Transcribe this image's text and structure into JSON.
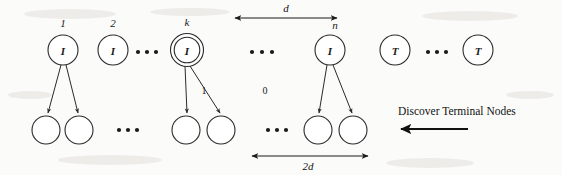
{
  "diagram": {
    "colors": {
      "stroke": "#2a2a2a",
      "text": "#1a1a1a",
      "background": "#fbfbfa",
      "flow_arrow": "#111111"
    },
    "internal_nodes": [
      {
        "id": "n1",
        "label": "I",
        "index": "1",
        "cx": 63,
        "cy": 50,
        "r": 15,
        "double": false
      },
      {
        "id": "n2",
        "label": "I",
        "index": "2",
        "cx": 113,
        "cy": 50,
        "r": 15,
        "double": false
      },
      {
        "id": "nk",
        "label": "I",
        "index": "k",
        "cx": 187,
        "cy": 50,
        "r": 15,
        "double": true
      },
      {
        "id": "nn",
        "label": "I",
        "index": "n",
        "cx": 330,
        "cy": 50,
        "r": 15,
        "double": false
      }
    ],
    "terminal_nodes": [
      {
        "id": "t1",
        "label": "T",
        "cx": 395,
        "cy": 50,
        "r": 15
      },
      {
        "id": "t2",
        "label": "T",
        "cx": 478,
        "cy": 50,
        "r": 15
      }
    ],
    "leaf_nodes": [
      {
        "id": "l1",
        "cx": 46,
        "cy": 130,
        "r": 14
      },
      {
        "id": "l2",
        "cx": 79,
        "cy": 130,
        "r": 14
      },
      {
        "id": "l3",
        "cx": 186,
        "cy": 130,
        "r": 14
      },
      {
        "id": "l4",
        "cx": 221,
        "cy": 130,
        "r": 14
      },
      {
        "id": "l5",
        "cx": 318,
        "cy": 130,
        "r": 14
      },
      {
        "id": "l6",
        "cx": 353,
        "cy": 130,
        "r": 14
      }
    ],
    "ellipses_top": [
      {
        "id": "e-top-1",
        "cx": 147,
        "cy": 52
      },
      {
        "id": "e-top-2",
        "cx": 262,
        "cy": 52
      },
      {
        "id": "e-top-3",
        "cx": 437,
        "cy": 52
      }
    ],
    "ellipses_bottom": [
      {
        "id": "e-bot-1",
        "cx": 128,
        "cy": 130
      },
      {
        "id": "e-bot-2",
        "cx": 277,
        "cy": 130
      }
    ],
    "edge_labels": [
      {
        "id": "edge-one",
        "text": "1",
        "x": 204,
        "y": 94
      },
      {
        "id": "edge-zero",
        "text": "0",
        "x": 265,
        "y": 94
      }
    ],
    "measures": [
      {
        "id": "measure-d",
        "text": "d",
        "x1": 235,
        "y1": 18,
        "x2": 337,
        "y2": 18,
        "label_x": 286,
        "label_y": 11
      },
      {
        "id": "measure-2d",
        "text": "2d",
        "x1": 252,
        "y1": 156,
        "x2": 368,
        "y2": 156,
        "label_x": 308,
        "label_y": 170
      }
    ],
    "annotation": {
      "caption": "Discover Terminal Nodes",
      "caption_x": 398,
      "caption_y": 115,
      "arrow_x1": 468,
      "arrow_y1": 129,
      "arrow_x2": 400,
      "arrow_y2": 129
    }
  }
}
